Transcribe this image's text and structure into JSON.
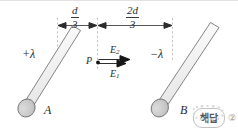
{
  "figure": {
    "dimensions": {
      "left_segment": {
        "numerator": "d",
        "denominator": "3",
        "label": "d/3"
      },
      "right_segment": {
        "numerator": "2d",
        "denominator": "3",
        "label": "2d/3"
      }
    },
    "rods": [
      {
        "id": "rod-a",
        "letter": "A",
        "charge_label": "+λ",
        "charge_sign": "positive",
        "fill_color": "#f2f2f2",
        "stroke_color": "#6e6e6e",
        "cap_color": "#c9c9c9"
      },
      {
        "id": "rod-b",
        "letter": "B",
        "charge_label": "−λ",
        "charge_sign": "negative",
        "fill_color": "#f2f2f2",
        "stroke_color": "#6e6e6e",
        "cap_color": "#c9c9c9"
      }
    ],
    "point": {
      "label": "P",
      "marker": "filled-dot",
      "color": "#1a1a1a"
    },
    "field_vectors": [
      {
        "id": "e2",
        "base": "E",
        "subscript": "2",
        "label": "E₂",
        "direction": "right",
        "position": "above"
      },
      {
        "id": "e1",
        "base": "E",
        "subscript": "1",
        "label": "E₁",
        "direction": "right",
        "position": "below"
      }
    ],
    "colors": {
      "ink": "#2c2c2c",
      "rod_fill": "#f2f2f2",
      "rod_outline": "#6e6e6e",
      "cap_fill": "#c9c9c9",
      "dimension_line": "#2b2b2b",
      "extension_line": "#a8a8a8",
      "background": "#ffffff"
    }
  },
  "watermark": {
    "text": "해답",
    "answer_number": "②"
  }
}
